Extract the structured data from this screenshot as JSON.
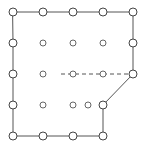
{
  "figure": {
    "type": "node-edge-diagram",
    "width": 144,
    "height": 154,
    "background_color": "#ffffff"
  },
  "grid": {
    "columns": 5,
    "rows": 5,
    "x_positions": [
      13,
      43,
      73,
      103,
      133
    ],
    "y_positions": [
      12,
      43,
      74,
      105,
      136
    ],
    "spacing_x": 30,
    "spacing_y": 31
  },
  "style": {
    "line_color": "#555555",
    "node_stroke_boundary": "#444444",
    "node_stroke_interior": "#666666",
    "node_fill": "#ffffff",
    "boundary_node_radius": 4,
    "interior_node_radius": 3,
    "dash_pattern": "4 3"
  },
  "nodes": {
    "boundary": [
      {
        "id": "n-0-0",
        "label": "top-left-corner",
        "x": 13,
        "y": 12,
        "r": 4
      },
      {
        "id": "n-1-0",
        "label": "top-edge-1",
        "x": 43,
        "y": 12,
        "r": 4
      },
      {
        "id": "n-2-0",
        "label": "top-edge-2",
        "x": 73,
        "y": 12,
        "r": 4
      },
      {
        "id": "n-3-0",
        "label": "top-edge-3",
        "x": 103,
        "y": 12,
        "r": 4
      },
      {
        "id": "n-4-0",
        "label": "top-right-corner",
        "x": 133,
        "y": 12,
        "r": 4
      },
      {
        "id": "n-4-1",
        "label": "right-edge-1",
        "x": 133,
        "y": 43,
        "r": 4
      },
      {
        "id": "n-4-2",
        "label": "right-cut-start",
        "x": 133,
        "y": 74,
        "r": 4
      },
      {
        "id": "n-3-3",
        "label": "cut-end",
        "x": 103,
        "y": 105,
        "r": 4
      },
      {
        "id": "n-3-4",
        "label": "bottom-right-corner",
        "x": 103,
        "y": 136,
        "r": 4
      },
      {
        "id": "n-2-4",
        "label": "bottom-edge-2",
        "x": 73,
        "y": 136,
        "r": 4
      },
      {
        "id": "n-1-4",
        "label": "bottom-edge-1",
        "x": 43,
        "y": 136,
        "r": 4
      },
      {
        "id": "n-0-4",
        "label": "bottom-left-corner",
        "x": 13,
        "y": 136,
        "r": 4
      },
      {
        "id": "n-0-3",
        "label": "left-edge-3",
        "x": 13,
        "y": 105,
        "r": 4
      },
      {
        "id": "n-0-2",
        "label": "left-edge-2",
        "x": 13,
        "y": 74,
        "r": 4
      },
      {
        "id": "n-0-1",
        "label": "left-edge-1",
        "x": 13,
        "y": 43,
        "r": 4
      }
    ],
    "interior": [
      {
        "id": "n-1-1",
        "label": "interior-r1-c1",
        "x": 43,
        "y": 43,
        "r": 3
      },
      {
        "id": "n-2-1",
        "label": "interior-r1-c2",
        "x": 73,
        "y": 43,
        "r": 3
      },
      {
        "id": "n-3-1",
        "label": "interior-r1-c3",
        "x": 103,
        "y": 43,
        "r": 3
      },
      {
        "id": "n-1-2",
        "label": "interior-r2-c1",
        "x": 43,
        "y": 74,
        "r": 3
      },
      {
        "id": "n-2-2",
        "label": "interior-r2-c2",
        "x": 73,
        "y": 74,
        "r": 3
      },
      {
        "id": "n-3-2",
        "label": "interior-r2-c3",
        "x": 103,
        "y": 74,
        "r": 3
      },
      {
        "id": "n-1-3",
        "label": "interior-r3-c1",
        "x": 43,
        "y": 105,
        "r": 3
      },
      {
        "id": "n-2-3",
        "label": "interior-r3-c2",
        "x": 73,
        "y": 105,
        "r": 3
      },
      {
        "id": "n-3b-3",
        "label": "interior-r3-c3",
        "x": 88,
        "y": 105,
        "r": 3
      }
    ]
  },
  "edges": {
    "boundary_path": "M13,12 L43,12 L73,12 L103,12 L133,12 L133,43 L133,74 L103,105 L103,136 L73,136 L43,136 L13,136 L13,105 L13,74 L13,43 Z",
    "boundary_label": "domain-outline",
    "cut_segment": {
      "label": "diagonal-cut",
      "x1": 133,
      "y1": 74,
      "x2": 103,
      "y2": 105
    },
    "dashed_segments": [
      {
        "label": "dashed-row-3",
        "x1": 61,
        "y1": 74,
        "x2": 133,
        "y2": 74
      }
    ]
  }
}
